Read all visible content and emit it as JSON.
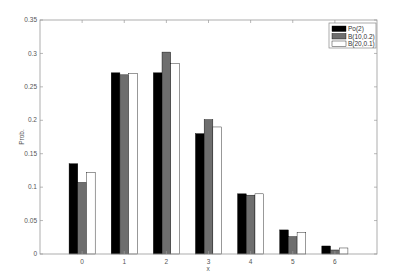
{
  "chart_data": {
    "type": "bar",
    "title": "",
    "xlabel": "x",
    "ylabel": "Prob.",
    "categories": [
      "0",
      "1",
      "2",
      "3",
      "4",
      "5",
      "6"
    ],
    "x": [
      0,
      1,
      2,
      3,
      4,
      5,
      6
    ],
    "series": [
      {
        "name": "Po(2)",
        "color": "#000000",
        "values": [
          0.135,
          0.271,
          0.271,
          0.18,
          0.09,
          0.036,
          0.012
        ]
      },
      {
        "name": "B(10,0.2)",
        "color": "#6e6e6e",
        "values": [
          0.107,
          0.268,
          0.302,
          0.201,
          0.088,
          0.026,
          0.006
        ]
      },
      {
        "name": "B(20,0.1)",
        "color": "#ffffff",
        "values": [
          0.122,
          0.27,
          0.285,
          0.19,
          0.09,
          0.032,
          0.009
        ]
      }
    ],
    "xlim": [
      -1,
      7
    ],
    "ylim": [
      0,
      0.35
    ],
    "yticks": [
      0,
      0.05,
      0.1,
      0.15,
      0.2,
      0.25,
      0.3,
      0.35
    ],
    "ytick_labels": [
      "0",
      "0.05",
      "0.1",
      "0.15",
      "0.2",
      "0.25",
      "0.3",
      "0.35"
    ],
    "xticks": [
      0,
      1,
      2,
      3,
      4,
      5,
      6
    ],
    "grid": false,
    "legend_position": "upper right"
  }
}
